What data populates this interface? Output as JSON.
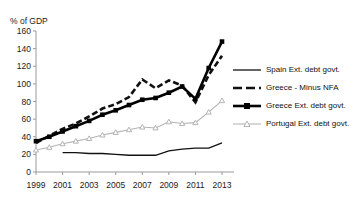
{
  "figure": {
    "ghost_text_top": "",
    "y_axis_unit": "% of GDP"
  },
  "chart_data": {
    "type": "line",
    "title": "",
    "subtitle": "",
    "xlabel": "",
    "ylabel": "% of GDP",
    "ylim": [
      0,
      160
    ],
    "ytick_values": [
      0,
      20,
      40,
      60,
      80,
      100,
      120,
      140,
      160
    ],
    "ytick_labels": [
      "0",
      "20",
      "40",
      "60",
      "80",
      "100",
      "120",
      "140",
      "160"
    ],
    "xlim": [
      1999,
      2013
    ],
    "x": [
      1999,
      2000,
      2001,
      2002,
      2003,
      2004,
      2005,
      2006,
      2007,
      2008,
      2009,
      2010,
      2011,
      2012,
      2013
    ],
    "xtick_values": [
      1999,
      2001,
      2003,
      2005,
      2007,
      2009,
      2011,
      2013
    ],
    "xtick_labels": [
      "1999",
      "2001",
      "2003",
      "2005",
      "2007",
      "2009",
      "2011",
      "2013"
    ],
    "grid": false,
    "legend_position": "right",
    "series": [
      {
        "name": "Spain Ext. debt govt.",
        "style": "solid-thin",
        "marker": "none",
        "color": "#111111",
        "x": [
          2001,
          2002,
          2003,
          2004,
          2005,
          2006,
          2007,
          2008,
          2009,
          2010,
          2011,
          2012,
          2013
        ],
        "values": [
          22,
          22,
          21,
          21,
          20,
          19,
          19,
          19,
          24,
          26,
          27,
          27,
          33
        ]
      },
      {
        "name": "Greece - Minus NFA",
        "style": "dashed",
        "marker": "none",
        "color": "#111111",
        "x": [
          1999,
          2000,
          2001,
          2002,
          2003,
          2004,
          2005,
          2006,
          2007,
          2008,
          2009,
          2010,
          2011,
          2012,
          2013
        ],
        "values": [
          33,
          41,
          49,
          55,
          63,
          72,
          77,
          85,
          105,
          95,
          104,
          98,
          79,
          110,
          132
        ]
      },
      {
        "name": "Greece Ext. debt govt.",
        "style": "solid-thick",
        "marker": "square",
        "color": "#000000",
        "x": [
          1999,
          2000,
          2001,
          2002,
          2003,
          2004,
          2005,
          2006,
          2007,
          2008,
          2009,
          2010,
          2011,
          2012,
          2013
        ],
        "values": [
          35,
          40,
          46,
          52,
          58,
          65,
          70,
          76,
          82,
          84,
          90,
          97,
          83,
          118,
          148
        ]
      },
      {
        "name": "Portugal Ext. debt govt.",
        "style": "solid-light",
        "marker": "triangle",
        "color": "#b4b4b4",
        "x": [
          1999,
          2000,
          2001,
          2002,
          2003,
          2004,
          2005,
          2006,
          2007,
          2008,
          2009,
          2010,
          2011,
          2012,
          2013
        ],
        "values": [
          25,
          28,
          32,
          35,
          38,
          42,
          45,
          48,
          51,
          50,
          57,
          55,
          56,
          68,
          81
        ]
      }
    ]
  },
  "legend": {
    "items": [
      {
        "label": "Spain Ext. debt govt.",
        "key": "solid-thin-key"
      },
      {
        "label": "Greece - Minus NFA",
        "key": "dashed-key"
      },
      {
        "label": "Greece Ext. debt govt.",
        "key": "solid-thick-square-key"
      },
      {
        "label": "Portugal Ext. debt govt.",
        "key": "light-triangle-key"
      }
    ]
  }
}
